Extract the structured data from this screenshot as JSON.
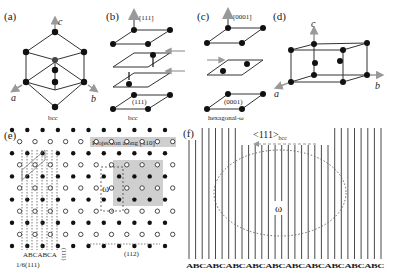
{
  "panels": {
    "a": {
      "label": "(a)",
      "caption": "bcc",
      "axes": [
        "a",
        "b",
        "c"
      ]
    },
    "b": {
      "label": "(b)",
      "caption": "bcc",
      "direction": "[111]",
      "plane": "(111)"
    },
    "c": {
      "label": "(c)",
      "caption": "hexagonal-ω",
      "direction": "[0001]",
      "plane": "(0001)"
    },
    "d": {
      "label": "(d)",
      "axes": [
        "a",
        "b",
        "c"
      ]
    },
    "e": {
      "label": "(e)",
      "projection_text": "Projection along [110]",
      "omega_label": "ω",
      "stacking": "ABCABCA",
      "spacing_label": "1/6(111)",
      "plane_label_vertical": "(111)",
      "direction_label": "(112)"
    },
    "f": {
      "label": "(f)",
      "direction_label": "<111>",
      "direction_subscript": "bcc",
      "omega_label": "ω",
      "stacking_sequence": "ABCABCABCABCABCABCABCABCABCABC"
    }
  },
  "colors": {
    "line": "#333333",
    "atom": "#111111",
    "arrow": "#999999",
    "shade": "#c8c8c8",
    "banner": "#cfcfcf"
  }
}
